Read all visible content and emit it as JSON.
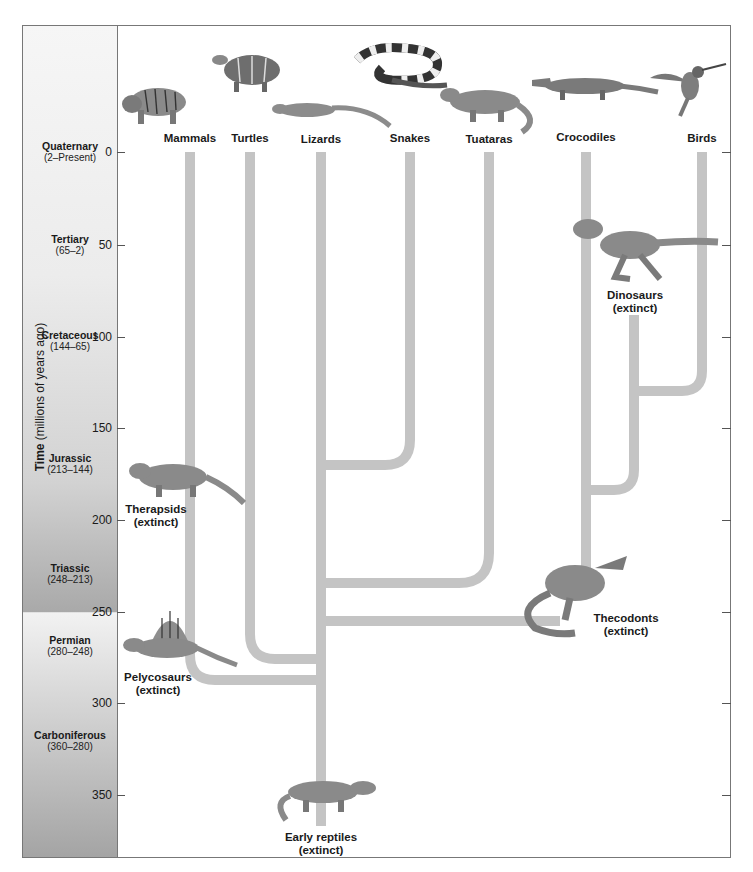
{
  "axis": {
    "title_bold": "Time",
    "title_rest": "(millions of years ago)",
    "ticks": [
      "0",
      "50",
      "100",
      "150",
      "200",
      "250",
      "300",
      "350"
    ]
  },
  "periods": [
    {
      "name": "Quaternary",
      "range": "(2–Present)"
    },
    {
      "name": "Tertiary",
      "range": "(65–2)"
    },
    {
      "name": "Cretaceous",
      "range": "(144–65)"
    },
    {
      "name": "Jurassic",
      "range": "(213–144)"
    },
    {
      "name": "Triassic",
      "range": "(248–213)"
    },
    {
      "name": "Permian",
      "range": "(280–248)"
    },
    {
      "name": "Carboniferous",
      "range": "(360–280)"
    }
  ],
  "living_groups": [
    "Mammals",
    "Turtles",
    "Lizards",
    "Snakes",
    "Tuataras",
    "Crocodiles",
    "Birds"
  ],
  "extinct_groups": [
    {
      "name": "Dinosaurs",
      "status": "(extinct)"
    },
    {
      "name": "Therapsids",
      "status": "(extinct)"
    },
    {
      "name": "Thecodonts",
      "status": "(extinct)"
    },
    {
      "name": "Pelycosaurs",
      "status": "(extinct)"
    },
    {
      "name": "Early reptiles",
      "status": "(extinct)"
    }
  ],
  "colors": {
    "branch": "#c4c4c4",
    "frame": "#777777"
  }
}
